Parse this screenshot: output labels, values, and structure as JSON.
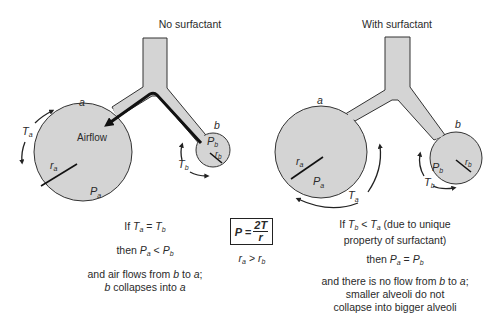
{
  "left_panel": {
    "title": "No surfactant",
    "labels": {
      "alveolus_a": "a",
      "alveolus_b": "b",
      "tension_a": "T",
      "tension_a_sub": "a",
      "tension_b": "T",
      "tension_b_sub": "b",
      "pressure_a": "P",
      "pressure_a_sub": "a",
      "pressure_b": "P",
      "pressure_b_sub": "b",
      "radius_a": "r",
      "radius_a_sub": "a",
      "radius_b": "r",
      "radius_b_sub": "b",
      "airflow": "Airflow"
    },
    "caption": {
      "line1_prefix": "If ",
      "line1_eq": " = ",
      "line2_prefix": "then ",
      "line2_op": " < ",
      "line3": "and air flows from ",
      "line3_mid": " to ",
      "line3_end": ";",
      "line4_end": " collapses into "
    }
  },
  "center": {
    "formula_lhs": "P = ",
    "formula_num": "2T",
    "formula_den": "r",
    "radius_relation_op": " > "
  },
  "right_panel": {
    "title": "With surfactant",
    "labels": {
      "alveolus_a": "a",
      "alveolus_b": "b",
      "tension_a": "T",
      "tension_a_sub": "a",
      "tension_b": "T",
      "tension_b_sub": "b",
      "pressure_a": "P",
      "pressure_a_sub": "a",
      "pressure_b": "P",
      "pressure_b_sub": "b",
      "radius_a": "r",
      "radius_a_sub": "a",
      "radius_b": "r",
      "radius_b_sub": "b"
    },
    "caption": {
      "line1_prefix": "If ",
      "line1_op": " < ",
      "line1_suffix": " (due to unique",
      "line2": "property of surfactant)",
      "line3_prefix": "then ",
      "line3_op": " = ",
      "line4": "and there is no flow from ",
      "line4_mid": " to ",
      "line4_end": ";",
      "line5": "smaller alveoli do not",
      "line6": "collapse into bigger alveoli"
    }
  },
  "colors": {
    "fill": "#d4d4d4",
    "stroke": "#333333",
    "ink": "#222222"
  }
}
